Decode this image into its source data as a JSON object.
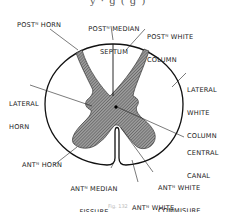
{
  "figure": {
    "title_fragment": "y  · g  ( g   )",
    "caption_fragment": "Fig. 132"
  },
  "labels": {
    "post_horn": {
      "line1": "POSTᴺ HORN"
    },
    "post_median_septum": {
      "line1": "POSTᴺ MEDIAN",
      "line2": "SEPTUM"
    },
    "post_white_column": {
      "line1": "POSTᴺ WHITE",
      "line2": "COLUMN"
    },
    "lateral_horn": {
      "line1": "LATERAL",
      "line2": "HORN"
    },
    "lateral_white_column": {
      "line1": "LATERAL",
      "line2": "WHITE",
      "line3": "COLUMN"
    },
    "central_canal": {
      "line1": "CENTRAL",
      "line2": "CANAL"
    },
    "ant_horn": {
      "line1": "ANTᴺ HORN"
    },
    "ant_median_fissure": {
      "line1": "ANTᴺ MEDIAN",
      "line2": "FISSURE"
    },
    "ant_white_commisure": {
      "line1": "ANTᴺ WHITE",
      "line2": "COMMISURE"
    },
    "ant_white_column": {
      "line1": "ANTᴺ WHITE",
      "line2": "COLUMN"
    }
  },
  "colors": {
    "outline": "#111111",
    "grey_matter_fill": "#8a8a8a",
    "hatch": "#555555",
    "white_matter": "#ffffff"
  }
}
